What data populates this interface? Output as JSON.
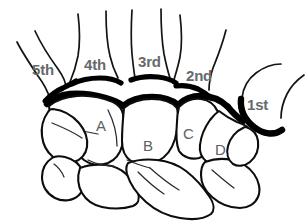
{
  "diagram": {
    "background_color": "#ffffff",
    "outline_color": "#0d0d0d",
    "label_color": "#666a6c",
    "joint_line_color": "#000000",
    "width": 308,
    "height": 222
  },
  "metatarsal_labels": [
    {
      "id": "fifth",
      "text": "5th",
      "x": 32,
      "y": 62
    },
    {
      "id": "fourth",
      "text": "4th",
      "x": 84,
      "y": 57
    },
    {
      "id": "third",
      "text": "3rd",
      "x": 138,
      "y": 54
    },
    {
      "id": "second",
      "text": "2nd",
      "x": 186,
      "y": 68
    },
    {
      "id": "first",
      "text": "1st",
      "x": 247,
      "y": 97
    }
  ],
  "carpal_labels": [
    {
      "id": "bone-a",
      "text": "A",
      "x": 96,
      "y": 118
    },
    {
      "id": "bone-b",
      "text": "B",
      "x": 143,
      "y": 138
    },
    {
      "id": "bone-c",
      "text": "C",
      "x": 183,
      "y": 126
    },
    {
      "id": "bone-d",
      "text": "D",
      "x": 215,
      "y": 142
    }
  ]
}
